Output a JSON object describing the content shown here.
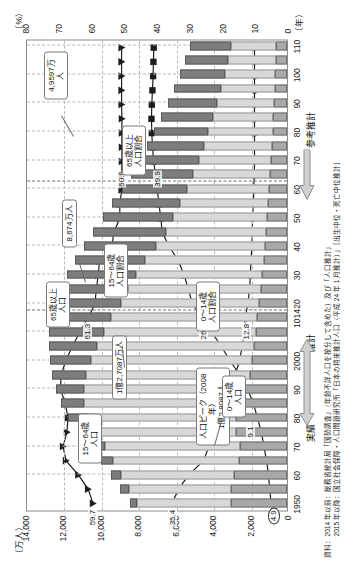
{
  "chart_data": {
    "type": "bar",
    "xlabel": "（年）",
    "ylabel": "（万人）",
    "y2label": "（%）",
    "ylim": [
      0,
      14000
    ],
    "y2lim": [
      0,
      80
    ],
    "grid": true,
    "legend_position": "callouts",
    "y_ticks": [
      "0",
      "2,000",
      "4,000",
      "6,000",
      "8,000",
      "10,000",
      "12,000",
      "14,000"
    ],
    "y2_ticks": [
      "0",
      "10",
      "20",
      "30",
      "40",
      "50",
      "60",
      "70",
      "80"
    ],
    "x_tick_labels": [
      "1950",
      "60",
      "70",
      "80",
      "90",
      "2000",
      "1014",
      "20",
      "30",
      "40",
      "50",
      "60",
      "70",
      "80",
      "90",
      "100",
      "110"
    ],
    "categories": [
      1950,
      1955,
      1960,
      1965,
      1970,
      1975,
      1980,
      1985,
      1990,
      1995,
      2000,
      2005,
      2010,
      2014,
      2020,
      2025,
      2030,
      2035,
      2040,
      2045,
      2050,
      2055,
      2060,
      2065,
      2070,
      2075,
      2080,
      2085,
      2090,
      2095,
      2100,
      2105,
      2110
    ],
    "series": [
      {
        "name": "0〜14歳人口",
        "key": "young",
        "color": "#a8a8a8",
        "values": [
          2979,
          2980,
          2843,
          2553,
          2515,
          2722,
          2751,
          2603,
          2249,
          2001,
          1847,
          1752,
          1684,
          1623,
          1507,
          1407,
          1321,
          1246,
          1194,
          1138,
          1077,
          1012,
          951,
          898,
          852,
          810,
          770,
          732,
          696,
          662,
          630,
          600,
          572
        ]
      },
      {
        "name": "15〜64歳人口",
        "key": "working",
        "color": "#d8d8d8",
        "values": [
          5017,
          5473,
          6047,
          6744,
          7212,
          7581,
          7883,
          8251,
          8590,
          8716,
          8622,
          8409,
          8103,
          7785,
          7341,
          7085,
          6773,
          6343,
          5787,
          5353,
          5001,
          4706,
          4418,
          4136,
          3877,
          3649,
          3437,
          3235,
          3047,
          2870,
          2703,
          2546,
          2397
        ]
      },
      {
        "name": "65歳以上人口",
        "key": "elderly",
        "color": "#7d7d7d",
        "values": [
          411,
          475,
          540,
          618,
          733,
          887,
          1065,
          1247,
          1493,
          1828,
          2204,
          2576,
          2948,
          3300,
          3612,
          3657,
          3685,
          3741,
          3868,
          3856,
          3768,
          3626,
          3464,
          3305,
          3176,
          3041,
          2904,
          2767,
          2638,
          2519,
          2404,
          2294,
          2190
        ]
      }
    ],
    "pct_series": [
      {
        "name": "15〜64歳人口割合",
        "key": "pct_working",
        "marker": "triangle",
        "values": [
          59.7,
          61.2,
          64.2,
          68.0,
          68.9,
          67.7,
          67.4,
          68.2,
          69.7,
          69.5,
          68.1,
          66.1,
          63.8,
          61.3,
          59.1,
          58.7,
          58.1,
          57.7,
          53.9,
          53.3,
          51.5,
          51.4,
          50.9,
          50.9,
          50.8,
          50.8,
          50.8,
          50.8,
          50.9,
          50.9,
          50.9,
          50.9,
          50.9
        ]
      },
      {
        "name": "65歳以上人口割合",
        "key": "pct_elderly",
        "marker": "square",
        "values": [
          4.9,
          5.3,
          5.7,
          6.3,
          7.1,
          7.9,
          9.1,
          10.3,
          12.1,
          14.6,
          17.4,
          20.2,
          23.0,
          26.0,
          29.1,
          30.3,
          31.6,
          33.4,
          36.1,
          38.4,
          38.8,
          39.4,
          39.9,
          40.4,
          41.0,
          41.4,
          41.6,
          41.7,
          41.6,
          41.4,
          41.2,
          41.1,
          41.0
        ]
      },
      {
        "name": "0〜14歳人口割合",
        "key": "pct_young",
        "marker": "circle",
        "values": [
          35.4,
          33.4,
          30.2,
          25.7,
          24.0,
          24.3,
          23.5,
          21.5,
          18.2,
          16.0,
          14.6,
          13.8,
          13.2,
          12.8,
          12.1,
          11.5,
          11.3,
          11.1,
          10.8,
          10.7,
          10.6,
          10.4,
          10.2,
          10.1,
          10.0,
          10.0,
          10.0,
          10.0,
          10.0,
          10.0,
          10.0,
          10.0,
          10.0
        ]
      }
    ],
    "annotations": [
      {
        "id": "peak",
        "text": "人口ピーク（2008年）\n1億2,8087人"
      },
      {
        "id": "pop2014",
        "text": "1億2,7087万人"
      },
      {
        "id": "work2060",
        "text": "8,674万人"
      },
      {
        "id": "pop2110",
        "text": "4,9597万人"
      },
      {
        "id": "lbl_work_pct",
        "text": "15〜64歳\n人口割合"
      },
      {
        "id": "lbl_old_pct",
        "text": "65歳以上\n人口割合"
      },
      {
        "id": "lbl_young_pct",
        "text": "0〜14歳\n人口割合"
      },
      {
        "id": "lbl_old",
        "text": "65歳以上\n人口"
      },
      {
        "id": "lbl_work",
        "text": "15〜64歳\n人口"
      },
      {
        "id": "lbl_young",
        "text": "0〜14歳\n人口"
      }
    ],
    "value_labels": [
      {
        "id": "v_59_7",
        "text": "59.7"
      },
      {
        "id": "v_35_4",
        "text": "35.4"
      },
      {
        "id": "v_4_9",
        "text": "4.9"
      },
      {
        "id": "v_61_3",
        "text": "61.3"
      },
      {
        "id": "v_26_0",
        "text": "26.0"
      },
      {
        "id": "v_12_8",
        "text": "12.8"
      },
      {
        "id": "v_9_1",
        "text": "9.1"
      },
      {
        "id": "v_50_9",
        "text": "50.9"
      },
      {
        "id": "v_39_9",
        "text": "39.9"
      }
    ],
    "period_bands": [
      {
        "id": "actual",
        "label": "実績"
      },
      {
        "id": "estimate",
        "label": "推計"
      },
      {
        "id": "ref",
        "label": "参考推計"
      }
    ],
    "source_note": "資料：2014 年以前：総務省統計局「国勢調査」（年齢不詳人口を按分して含めた）及び「人口推計」\n　　　2015 年以降：国立社会保障・人口問題研究所「日本の将来推計人口（平成 24 年 1 月推計）」［出生中位・死亡中位推計］"
  }
}
